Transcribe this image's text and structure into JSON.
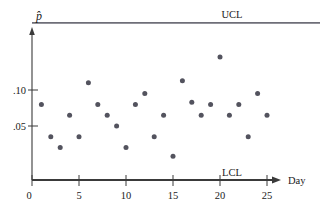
{
  "chart_data": {
    "type": "scatter",
    "title": "",
    "subtitle": "",
    "xlabel": "Day",
    "ylabel": "p̂",
    "xlim": [
      0,
      28.5
    ],
    "ylim": [
      0,
      0.175
    ],
    "grid": false,
    "legend": "none",
    "x_ticks": [
      0,
      5,
      10,
      15,
      20,
      25
    ],
    "x_tick_labels": [
      "0",
      "5",
      "10",
      "15",
      "20",
      "25"
    ],
    "y_ticks": [
      0.05,
      0.1
    ],
    "y_tick_labels": [
      ".05",
      ".10"
    ],
    "x": [
      1,
      2,
      3,
      4,
      5,
      6,
      7,
      8,
      9,
      10,
      11,
      12,
      13,
      14,
      15,
      16,
      17,
      18,
      19,
      20,
      21,
      22,
      23,
      24,
      25
    ],
    "values": [
      0.07,
      0.04,
      0.03,
      0.06,
      0.04,
      0.09,
      0.07,
      0.06,
      0.05,
      0.03,
      0.07,
      0.08,
      0.04,
      0.06,
      0.022,
      0.092,
      0.072,
      0.06,
      0.07,
      0.114,
      0.06,
      0.07,
      0.04,
      0.08,
      0.06
    ],
    "annotations": [
      {
        "name": "ucl",
        "label": "UCL",
        "value": 0.1455
      },
      {
        "name": "lcl",
        "label": "LCL",
        "value": 0.0
      }
    ]
  },
  "labels": {
    "ucl": "UCL",
    "lcl": "LCL",
    "x_axis_title": "Day",
    "y_axis_title": "p̂",
    "y_tick_10": ".10",
    "y_tick_05": ".05",
    "x_tick_0": "0",
    "x_tick_5": "5",
    "x_tick_10": "10",
    "x_tick_15": "15",
    "x_tick_20": "20",
    "x_tick_25": "25"
  },
  "colors": {
    "axis": "#3a3a3a",
    "limit_line": "#6e6e78",
    "point": "#53535e",
    "background": "#ffffff"
  }
}
